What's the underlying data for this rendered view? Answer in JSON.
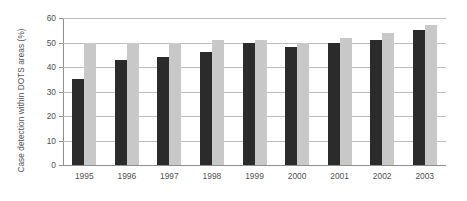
{
  "chart_data": {
    "type": "bar",
    "title": "",
    "xlabel": "",
    "ylabel": "Case detection within DOTS areas (%)",
    "ylim": [
      0,
      60
    ],
    "yticks": [
      0,
      10,
      20,
      30,
      40,
      50,
      60
    ],
    "ytick_labels": [
      "0",
      "10",
      "20",
      "30",
      "40",
      "50",
      "60"
    ],
    "grid": true,
    "legend": "none",
    "categories": [
      "1995",
      "1996",
      "1997",
      "1998",
      "1999",
      "2000",
      "2001",
      "2002",
      "2003"
    ],
    "series": [
      {
        "name": "series-a",
        "color": "#2b2b2b",
        "values": [
          35,
          43,
          44,
          46,
          50,
          48,
          50,
          51,
          55
        ]
      },
      {
        "name": "series-b",
        "color": "#c8c8c8",
        "values": [
          50,
          50,
          50,
          51,
          51,
          50,
          52,
          54,
          57
        ]
      }
    ]
  },
  "colors": {
    "background": "#ffffff",
    "grid": "#bdbdbd",
    "axis": "#8f8f8f",
    "text": "#4f4f4f",
    "series_a": "#2b2b2b",
    "series_b": "#c8c8c8"
  }
}
